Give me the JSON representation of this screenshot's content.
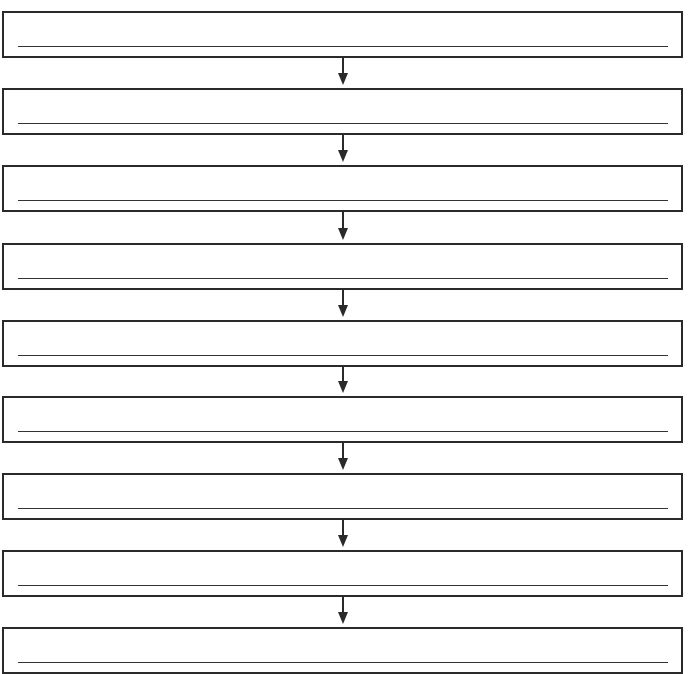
{
  "diagram": {
    "type": "vertical-flowchart-worksheet",
    "colors": {
      "stroke": "#2a2a2a",
      "background": "#ffffff"
    },
    "boxes": [
      {
        "label": "",
        "top": 11
      },
      {
        "label": "",
        "top": 88
      },
      {
        "label": "",
        "top": 165
      },
      {
        "label": "",
        "top": 243
      },
      {
        "label": "",
        "top": 320
      },
      {
        "label": "",
        "top": 396
      },
      {
        "label": "",
        "top": 473
      },
      {
        "label": "",
        "top": 550
      },
      {
        "label": "",
        "top": 627
      }
    ],
    "arrows": [
      {
        "from": 0,
        "to": 1
      },
      {
        "from": 1,
        "to": 2
      },
      {
        "from": 2,
        "to": 3
      },
      {
        "from": 3,
        "to": 4
      },
      {
        "from": 4,
        "to": 5
      },
      {
        "from": 5,
        "to": 6
      },
      {
        "from": 6,
        "to": 7
      },
      {
        "from": 7,
        "to": 8
      }
    ]
  }
}
